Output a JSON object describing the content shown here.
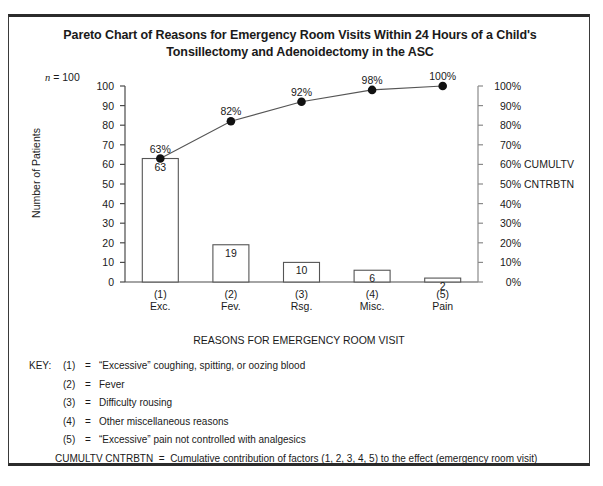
{
  "title": "Pareto Chart of Reasons for Emergency Room Visits Within 24 Hours of a Child's Tonsillectomy and Adenoidectomy in the ASC",
  "sample_size_label": "n = 100",
  "sample_size_prefix": "n",
  "sample_size_value": " = 100",
  "key": {
    "heading": "KEY:",
    "items": [
      {
        "num": "(1)",
        "eq": "=",
        "text": "“Excessive” coughing, spitting, or oozing blood"
      },
      {
        "num": "(2)",
        "eq": "=",
        "text": "Fever"
      },
      {
        "num": "(3)",
        "eq": "=",
        "text": "Difficulty rousing"
      },
      {
        "num": "(4)",
        "eq": "=",
        "text": "Other miscellaneous reasons"
      },
      {
        "num": "(5)",
        "eq": "=",
        "text": "“Excessive” pain not controlled with analgesics"
      }
    ],
    "footer_label": "CUMULTV CNTRBTN",
    "footer_eq": "=",
    "footer_text": "Cumulative contribution of factors (1, 2, 3, 4, 5) to the effect (emergency room visit)"
  },
  "right_axis_annotations": {
    "cumultv": "CUMULTV",
    "cntrbtn": "CNTRBTN"
  },
  "chart_data": {
    "type": "bar",
    "title": "Pareto Chart of Reasons for Emergency Room Visits Within 24 Hours of a Child's Tonsillectomy and Adenoidectomy in the ASC",
    "xlabel": "REASONS FOR EMERGENCY ROOM VISIT",
    "ylabel": "Number of Patients",
    "y2label": "CUMULTV CNTRBTN",
    "categories": [
      "(1)",
      "(2)",
      "(3)",
      "(4)",
      "(5)"
    ],
    "category_names": [
      "Exc.",
      "Fev.",
      "Rsg.",
      "Misc.",
      "Pain"
    ],
    "values": [
      63,
      19,
      10,
      6,
      2
    ],
    "bar_labels": [
      "63",
      "19",
      "10",
      "6",
      "2"
    ],
    "cumulative": [
      63,
      82,
      92,
      98,
      100
    ],
    "cumulative_labels": [
      "63%",
      "82%",
      "92%",
      "98%",
      "100%"
    ],
    "ylim": [
      0,
      100
    ],
    "y2lim": [
      0,
      100
    ],
    "yticks": [
      100,
      90,
      80,
      70,
      60,
      50,
      40,
      30,
      20,
      10,
      0
    ],
    "ytick_labels": [
      "100",
      "90",
      "80",
      "70",
      "60",
      "50",
      "40",
      "30",
      "20",
      "10",
      "0"
    ],
    "y2tick_labels": [
      "100%",
      "90%",
      "80%",
      "70%",
      "60%",
      "50%",
      "40%",
      "30%",
      "20%",
      "10%",
      "0%"
    ],
    "grid": false,
    "legend": "none",
    "bar_color": "#ffffff",
    "bar_edge_color": "#555555",
    "line_color": "#555555",
    "marker_color": "#111111"
  }
}
